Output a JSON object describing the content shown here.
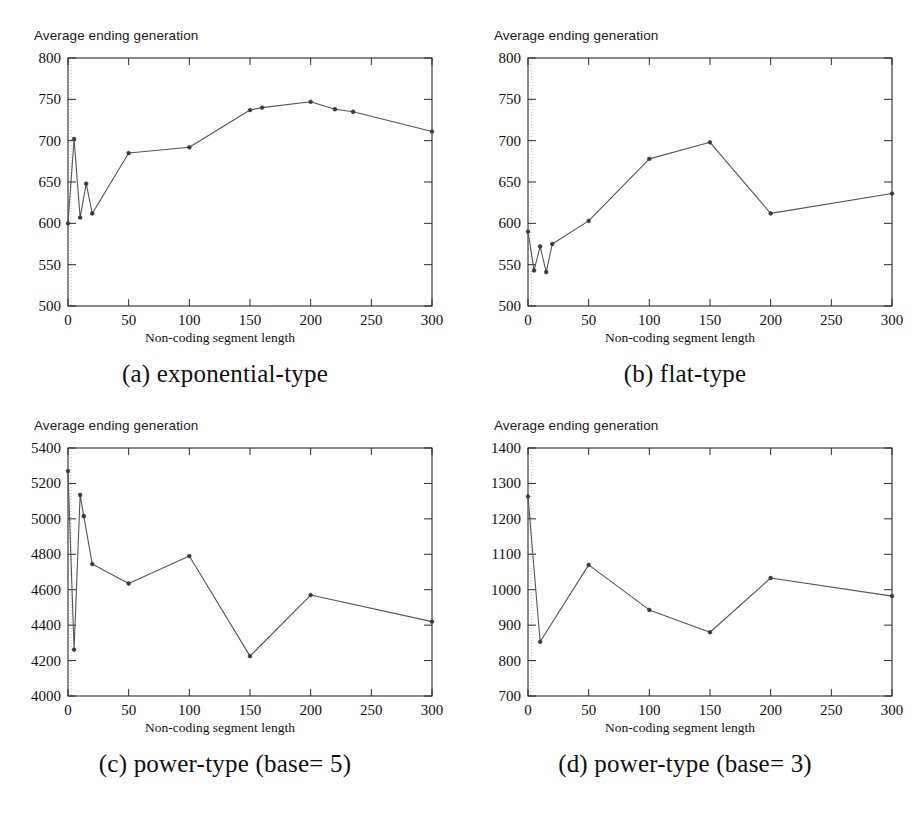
{
  "figure": {
    "panels": [
      "a",
      "b",
      "c",
      "d"
    ]
  },
  "common": {
    "ylabel": "Average ending generation",
    "xlabel": "Non-coding segment  length"
  },
  "panel_a": {
    "caption": "(a) exponential-type",
    "ylabel": "Average ending generation",
    "xlabel": "Non-coding segment  length",
    "xticks": [
      "0",
      "50",
      "100",
      "150",
      "200",
      "250",
      "300"
    ],
    "yticks": [
      "500",
      "550",
      "600",
      "650",
      "700",
      "750",
      "800"
    ]
  },
  "panel_b": {
    "caption": "(b) flat-type",
    "ylabel": "Average ending generation",
    "xlabel": "Non-coding segment  length",
    "xticks": [
      "0",
      "50",
      "100",
      "150",
      "200",
      "250",
      "300"
    ],
    "yticks": [
      "500",
      "550",
      "600",
      "650",
      "700",
      "750",
      "800"
    ]
  },
  "panel_c": {
    "caption": "(c) power-type (base= 5)",
    "ylabel": "Average ending generation",
    "xlabel": "Non-coding segment  length",
    "xticks": [
      "0",
      "50",
      "100",
      "150",
      "200",
      "250",
      "300"
    ],
    "yticks": [
      "4000",
      "4200",
      "4400",
      "4600",
      "4800",
      "5000",
      "5200",
      "5400"
    ]
  },
  "panel_d": {
    "caption": "(d) power-type (base= 3)",
    "ylabel": "Average ending generation",
    "xlabel": "Non-coding segment  length",
    "xticks": [
      "0",
      "50",
      "100",
      "150",
      "200",
      "250",
      "300"
    ],
    "yticks": [
      "700",
      "800",
      "900",
      "1000",
      "1100",
      "1200",
      "1300",
      "1400"
    ]
  },
  "chart_data": [
    {
      "id": "a",
      "type": "line",
      "title": "(a) exponential-type",
      "xlabel": "Non-coding segment  length",
      "ylabel": "Average ending generation",
      "xlim": [
        0,
        300
      ],
      "ylim": [
        500,
        800
      ],
      "xticks": [
        0,
        50,
        100,
        150,
        200,
        250,
        300
      ],
      "yticks": [
        500,
        550,
        600,
        650,
        700,
        750,
        800
      ],
      "grid": false,
      "legend": "none",
      "markers": true,
      "line_color": "#555555",
      "x": [
        0,
        5,
        10,
        15,
        20,
        50,
        100,
        150,
        160,
        200,
        220,
        235,
        300
      ],
      "y": [
        600,
        702,
        607,
        648,
        612,
        685,
        692,
        737,
        740,
        747,
        738,
        735,
        711
      ]
    },
    {
      "id": "b",
      "type": "line",
      "title": "(b) flat-type",
      "xlabel": "Non-coding segment  length",
      "ylabel": "Average ending generation",
      "xlim": [
        0,
        300
      ],
      "ylim": [
        500,
        800
      ],
      "xticks": [
        0,
        50,
        100,
        150,
        200,
        250,
        300
      ],
      "yticks": [
        500,
        550,
        600,
        650,
        700,
        750,
        800
      ],
      "grid": false,
      "legend": "none",
      "markers": true,
      "line_color": "#555555",
      "x": [
        0,
        5,
        10,
        15,
        20,
        50,
        100,
        150,
        200,
        300
      ],
      "y": [
        590,
        543,
        572,
        541,
        575,
        603,
        678,
        698,
        612,
        636
      ]
    },
    {
      "id": "c",
      "type": "line",
      "title": "(c) power-type (base= 5)",
      "xlabel": "Non-coding segment  length",
      "ylabel": "Average ending generation",
      "xlim": [
        0,
        300
      ],
      "ylim": [
        4000,
        5400
      ],
      "xticks": [
        0,
        50,
        100,
        150,
        200,
        250,
        300
      ],
      "yticks": [
        4000,
        4200,
        4400,
        4600,
        4800,
        5000,
        5200,
        5400
      ],
      "grid": false,
      "legend": "none",
      "markers": true,
      "line_color": "#555555",
      "x": [
        0,
        5,
        10,
        13,
        20,
        50,
        100,
        150,
        200,
        300
      ],
      "y": [
        5270,
        4262,
        5135,
        5015,
        4745,
        4635,
        4790,
        4225,
        4570,
        4420
      ]
    },
    {
      "id": "d",
      "type": "line",
      "title": "(d) power-type (base= 3)",
      "xlabel": "Non-coding segment  length",
      "ylabel": "Average ending generation",
      "xlim": [
        0,
        300
      ],
      "ylim": [
        700,
        1400
      ],
      "xticks": [
        0,
        50,
        100,
        150,
        200,
        250,
        300
      ],
      "yticks": [
        700,
        800,
        900,
        1000,
        1100,
        1200,
        1300,
        1400
      ],
      "grid": false,
      "legend": "none",
      "markers": true,
      "line_color": "#555555",
      "x": [
        0,
        10,
        50,
        100,
        150,
        200,
        300
      ],
      "y": [
        1263,
        853,
        1070,
        943,
        880,
        1033,
        982
      ]
    }
  ]
}
